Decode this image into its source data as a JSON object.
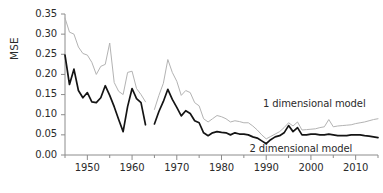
{
  "chart_data": {
    "type": "line",
    "title": "",
    "subtitle": "",
    "xlabel": "",
    "ylabel": "MSE",
    "xlim": [
      1945,
      2015
    ],
    "ylim": [
      0.0,
      0.35
    ],
    "grid": false,
    "legend_position": "inline-annotation",
    "y_ticks": [
      0.0,
      0.05,
      0.1,
      0.15,
      0.2,
      0.25,
      0.3,
      0.35
    ],
    "y_tick_labels": [
      "0.00",
      "0.05",
      "0.10",
      "0.15",
      "0.20",
      "0.25",
      "0.30",
      "0.35"
    ],
    "x_ticks": [
      1950,
      1960,
      1970,
      1980,
      1990,
      2000,
      2010
    ],
    "x_tick_labels": [
      "1950",
      "1960",
      "1970",
      "1980",
      "1990",
      "2000",
      "2010"
    ],
    "x_minor_ticks": [
      1945,
      1955,
      1965,
      1975,
      1985,
      1995,
      2005,
      2015
    ],
    "annotations": [
      {
        "text": "1 dimensional model",
        "x": 2000,
        "y": 0.123,
        "series": "1 dimensional model"
      },
      {
        "text": "2 dimensional model",
        "x": 1997,
        "y": 0.012,
        "series": "2 dimensional model"
      }
    ],
    "series": [
      {
        "name": "1 dimensional model",
        "color": "#b3b3b3",
        "x": [
          1945,
          1946,
          1947,
          1948,
          1949,
          1950,
          1951,
          1952,
          1953,
          1954,
          1955,
          1956,
          1957,
          1958,
          1959,
          1960,
          1961,
          1962,
          1963,
          1965,
          1966,
          1967,
          1968,
          1969,
          1970,
          1971,
          1972,
          1973,
          1974,
          1975,
          1976,
          1977,
          1978,
          1979,
          1980,
          1981,
          1982,
          1983,
          1984,
          1985,
          1986,
          1987,
          1988,
          1989,
          1990,
          1991,
          1992,
          1993,
          1994,
          1995,
          1996,
          1997,
          1998,
          1999,
          2000,
          2001,
          2002,
          2003,
          2004,
          2005,
          2006,
          2007,
          2008,
          2009,
          2010,
          2011,
          2012,
          2013,
          2014,
          2015
        ],
        "values": [
          0.34,
          0.305,
          0.3,
          0.268,
          0.252,
          0.248,
          0.23,
          0.2,
          0.22,
          0.225,
          0.278,
          0.18,
          0.158,
          0.15,
          0.205,
          0.208,
          0.165,
          0.15,
          0.132,
          0.113,
          0.148,
          0.178,
          0.237,
          0.205,
          0.183,
          0.148,
          0.16,
          0.155,
          0.13,
          0.122,
          0.09,
          0.082,
          0.09,
          0.098,
          0.095,
          0.09,
          0.082,
          0.085,
          0.083,
          0.08,
          0.08,
          0.072,
          0.062,
          0.05,
          0.04,
          0.046,
          0.052,
          0.058,
          0.068,
          0.08,
          0.072,
          0.082,
          0.062,
          0.063,
          0.064,
          0.065,
          0.068,
          0.07,
          0.088,
          0.07,
          0.072,
          0.073,
          0.074,
          0.075,
          0.078,
          0.08,
          0.082,
          0.085,
          0.088,
          0.09
        ]
      },
      {
        "name": "2 dimensional model",
        "color": "#141414",
        "x": [
          1945,
          1946,
          1947,
          1948,
          1949,
          1950,
          1951,
          1952,
          1953,
          1954,
          1955,
          1956,
          1957,
          1958,
          1959,
          1960,
          1961,
          1962,
          1963,
          1965,
          1966,
          1967,
          1968,
          1969,
          1970,
          1971,
          1972,
          1973,
          1974,
          1975,
          1976,
          1977,
          1978,
          1979,
          1980,
          1981,
          1982,
          1983,
          1984,
          1985,
          1986,
          1987,
          1988,
          1989,
          1990,
          1991,
          1992,
          1993,
          1994,
          1995,
          1996,
          1997,
          1998,
          1999,
          2000,
          2001,
          2002,
          2003,
          2004,
          2005,
          2006,
          2007,
          2008,
          2009,
          2010,
          2011,
          2012,
          2013,
          2014,
          2015
        ],
        "values": [
          0.248,
          0.175,
          0.213,
          0.16,
          0.142,
          0.155,
          0.132,
          0.13,
          0.142,
          0.172,
          0.148,
          0.12,
          0.088,
          0.058,
          0.12,
          0.165,
          0.14,
          0.13,
          0.075,
          0.077,
          0.108,
          0.133,
          0.163,
          0.138,
          0.118,
          0.097,
          0.11,
          0.103,
          0.085,
          0.08,
          0.055,
          0.048,
          0.055,
          0.058,
          0.056,
          0.055,
          0.05,
          0.055,
          0.052,
          0.052,
          0.05,
          0.045,
          0.042,
          0.035,
          0.028,
          0.038,
          0.045,
          0.048,
          0.055,
          0.073,
          0.058,
          0.068,
          0.05,
          0.05,
          0.052,
          0.052,
          0.05,
          0.05,
          0.052,
          0.05,
          0.048,
          0.048,
          0.048,
          0.05,
          0.05,
          0.05,
          0.048,
          0.047,
          0.045,
          0.043
        ]
      }
    ]
  }
}
